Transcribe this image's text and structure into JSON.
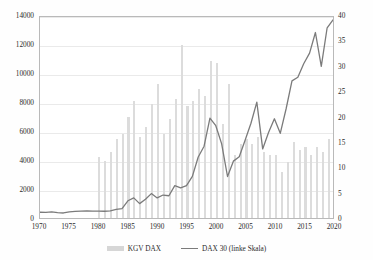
{
  "chart_data": {
    "type": "bar",
    "title": "",
    "subtitle": "",
    "xlabel": "",
    "ylabel": "",
    "y2label": "",
    "grid": true,
    "legend_position": "bottom",
    "xlim": [
      1970,
      2020
    ],
    "xticks": [
      "1970",
      "1975",
      "1980",
      "1985",
      "1990",
      "1995",
      "2000",
      "2005",
      "2010",
      "2015",
      "2020"
    ],
    "ylim": [
      0,
      14000
    ],
    "yticks": [
      "0",
      "2000",
      "4000",
      "6000",
      "8000",
      "10000",
      "12000",
      "14000"
    ],
    "y2lim": [
      0,
      40
    ],
    "y2ticks": [
      "0",
      "5",
      "10",
      "15",
      "20",
      "25",
      "30",
      "35",
      "40"
    ],
    "x": [
      1970,
      1971,
      1972,
      1973,
      1974,
      1975,
      1976,
      1977,
      1978,
      1979,
      1980,
      1981,
      1982,
      1983,
      1984,
      1985,
      1986,
      1987,
      1988,
      1989,
      1990,
      1991,
      1992,
      1993,
      1994,
      1995,
      1996,
      1997,
      1998,
      1999,
      2000,
      2001,
      2002,
      2003,
      2004,
      2005,
      2006,
      2007,
      2008,
      2009,
      2010,
      2011,
      2012,
      2013,
      2014,
      2015,
      2016,
      2017,
      2018,
      2019,
      2020
    ],
    "series": [
      {
        "name": "KGV DAX",
        "type": "bar",
        "axis": "right",
        "color": "#dcdcdc",
        "values": [
          null,
          null,
          null,
          null,
          null,
          null,
          null,
          null,
          null,
          null,
          12.0,
          11.2,
          13.0,
          15.5,
          16.5,
          20.0,
          23.0,
          16.0,
          18.0,
          22.5,
          26.5,
          16.5,
          19.5,
          23.5,
          34.0,
          22.0,
          23.0,
          25.5,
          24.0,
          31.0,
          30.5,
          18.5,
          26.5,
          12.5,
          14.5,
          15.5,
          14.5,
          16.0,
          13.0,
          12.5,
          12.5,
          9.0,
          11.0,
          15.0,
          13.5,
          14.0,
          12.5,
          14.0,
          13.0,
          15.5,
          null
        ]
      },
      {
        "name": "DAX 30 (linke Skala)",
        "type": "line",
        "axis": "left",
        "color": "#7b7b7b",
        "values": [
          400,
          390,
          420,
          380,
          350,
          430,
          460,
          480,
          500,
          480,
          480,
          470,
          500,
          600,
          650,
          1200,
          1400,
          1000,
          1300,
          1700,
          1400,
          1600,
          1550,
          2250,
          2100,
          2250,
          2900,
          4250,
          5000,
          6960,
          6430,
          5160,
          2890,
          3960,
          4260,
          5410,
          6600,
          8070,
          4810,
          5960,
          6910,
          5900,
          7610,
          9550,
          9800,
          10740,
          11480,
          12920,
          10560,
          13250,
          13800
        ]
      }
    ]
  },
  "legend": {
    "entries": [
      {
        "label": "KGV DAX",
        "marker": "bar-swatch"
      },
      {
        "label": "DAX 30 (linke Skala)",
        "marker": "line-swatch"
      }
    ]
  },
  "colors": {
    "bar": "#dcdcdc",
    "line": "#7b7b7b",
    "grid": "#eaeaea",
    "frame": "#b9b9b9",
    "text": "#2b2b2b",
    "background": "#ffffff"
  }
}
